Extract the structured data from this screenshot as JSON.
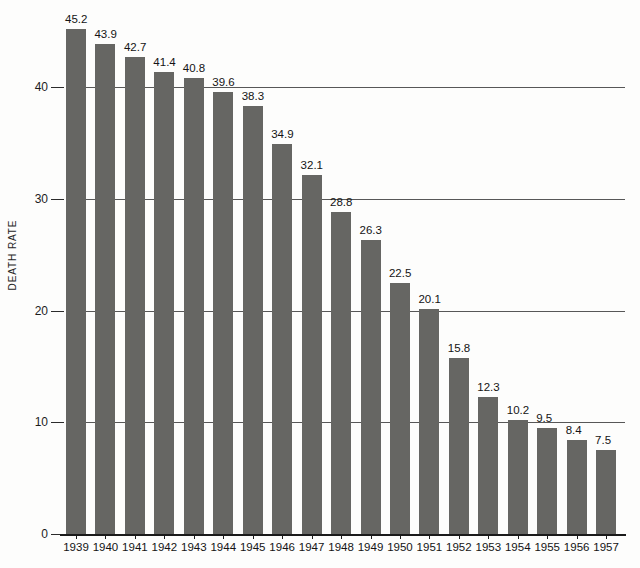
{
  "chart_data": {
    "type": "bar",
    "title": "",
    "subtitle": "",
    "xlabel": "",
    "ylabel": "DEATH RATE",
    "categories": [
      "1939",
      "1940",
      "1941",
      "1942",
      "1943",
      "1944",
      "1945",
      "1946",
      "1947",
      "1948",
      "1949",
      "1950",
      "1951",
      "1952",
      "1953",
      "1954",
      "1955",
      "1956",
      "1957"
    ],
    "values": [
      45.2,
      43.9,
      42.7,
      41.4,
      40.8,
      39.6,
      38.3,
      34.9,
      32.1,
      28.8,
      26.3,
      22.5,
      20.1,
      15.8,
      12.3,
      10.2,
      9.5,
      8.4,
      7.5
    ],
    "value_labels": [
      "45.2",
      "43.9",
      "42.7",
      "41.4",
      "40.8",
      "39.6",
      "38.3",
      "34.9",
      "32.1",
      "28.8",
      "26.3",
      "22.5",
      "20.1",
      "15.8",
      "12.3",
      "10.2",
      "9.5",
      "8.4",
      "7.5"
    ],
    "ylim": [
      0,
      48
    ],
    "yticks": [
      0,
      10,
      20,
      30,
      40
    ],
    "ytick_labels": [
      "0",
      "10",
      "20",
      "30",
      "40"
    ],
    "grid": true,
    "grid_axis": "y",
    "legend": null,
    "legend_position": "none",
    "series": [
      {
        "name": "Death Rate",
        "color": "#666663",
        "values": [
          45.2,
          43.9,
          42.7,
          41.4,
          40.8,
          39.6,
          38.3,
          34.9,
          32.1,
          28.8,
          26.3,
          22.5,
          20.1,
          15.8,
          12.3,
          10.2,
          9.5,
          8.4,
          7.5
        ]
      }
    ]
  },
  "style": {
    "bar_color": "#666663",
    "background": "#fdfdfc",
    "axis_color": "#1a1a1a",
    "grid_color": "#3a3a3a",
    "text_color": "#141414"
  }
}
